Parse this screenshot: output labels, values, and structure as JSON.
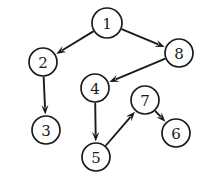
{
  "figure": {
    "background_color": "#ffffff",
    "stroke_color": "#1a1a1a",
    "node_fill_color": "#ffffff",
    "width": 209,
    "height": 186
  },
  "graph_data": {
    "type": "directed-graph",
    "node_count": 8,
    "edge_count": 7,
    "nodes": [
      {
        "id": "1",
        "label": "1",
        "cx": 107,
        "cy": 23,
        "r": 15
      },
      {
        "id": "2",
        "label": "2",
        "cx": 43,
        "cy": 62,
        "r": 14
      },
      {
        "id": "3",
        "label": "3",
        "cx": 46,
        "cy": 130,
        "r": 14
      },
      {
        "id": "4",
        "label": "4",
        "cx": 95,
        "cy": 88,
        "r": 14
      },
      {
        "id": "5",
        "label": "5",
        "cx": 96,
        "cy": 157,
        "r": 14
      },
      {
        "id": "6",
        "label": "6",
        "cx": 176,
        "cy": 133,
        "r": 14
      },
      {
        "id": "7",
        "label": "7",
        "cx": 145,
        "cy": 100,
        "r": 14
      },
      {
        "id": "8",
        "label": "8",
        "cx": 179,
        "cy": 53,
        "r": 14
      }
    ],
    "edges": [
      {
        "from": "1",
        "to": "2",
        "directed": true
      },
      {
        "from": "1",
        "to": "8",
        "directed": true
      },
      {
        "from": "2",
        "to": "3",
        "directed": true
      },
      {
        "from": "8",
        "to": "4",
        "directed": true
      },
      {
        "from": "4",
        "to": "5",
        "directed": true
      },
      {
        "from": "5",
        "to": "7",
        "directed": true
      },
      {
        "from": "7",
        "to": "6",
        "directed": true
      }
    ]
  }
}
